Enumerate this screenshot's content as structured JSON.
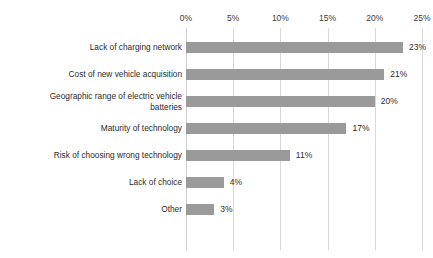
{
  "clipped_title": "",
  "chart_data": {
    "type": "bar",
    "orientation": "horizontal",
    "title": "",
    "subtitle": "",
    "xlabel": "",
    "ylabel": "",
    "categories": [
      "Lack of charging network",
      "Cost of new vehicle acquisition",
      "Geographic range of electric vehicle\nbatteries",
      "Maturity of technology",
      "Risk of choosing wrong technology",
      "Lack of choice",
      "Other"
    ],
    "values": [
      23,
      21,
      20,
      17,
      11,
      4,
      3
    ],
    "value_labels": [
      "23%",
      "21%",
      "20%",
      "17%",
      "11%",
      "4%",
      "3%"
    ],
    "xlim": [
      0,
      25
    ],
    "x_ticks": [
      0,
      5,
      10,
      15,
      20,
      25
    ],
    "x_tick_labels": [
      "0%",
      "5%",
      "10%",
      "15%",
      "20%",
      "25%"
    ],
    "x_axis_position": "top",
    "grid": true,
    "grid_axis": "x",
    "legend": false,
    "legend_position": "none",
    "bar_color": "#9a9a9a",
    "gridline_color": "#d9d9d9",
    "background_color": "#ffffff",
    "text_color": "#2b2b2b"
  }
}
